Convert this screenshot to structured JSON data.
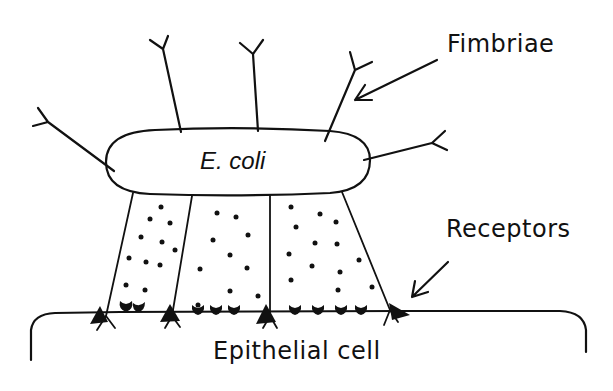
{
  "diagram": {
    "labels": {
      "fimbriae": "Fimbriae",
      "receptors": "Receptors",
      "bacterium": "E. coli",
      "host_cell": "Epithelial cell"
    },
    "stroke_color": "#111111",
    "background_color": "#ffffff"
  }
}
